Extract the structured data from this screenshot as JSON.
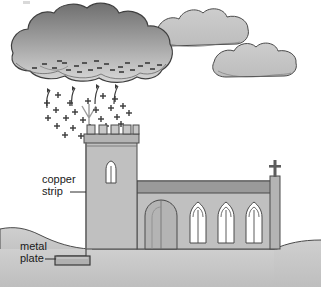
{
  "figure": {
    "labels": {
      "copper_strip_line1": "copper",
      "copper_strip_line2": "strip",
      "metal_plate_line1": "metal",
      "metal_plate_line2": "plate"
    },
    "charge_symbols": {
      "negative": "–",
      "positive": "+"
    },
    "counts": {
      "crenellations": 5,
      "nave_windows": 3,
      "clouds": 3,
      "charge_arrows": 4,
      "negative_charges": 22,
      "positive_charges": 24
    },
    "colors": {
      "outline": "#3a3a3a",
      "storm_cloud_top": "#7d7d7d",
      "storm_cloud_bottom": "#d2d2d2",
      "light_cloud": "#c3c3c3",
      "wall": "#c0c0c0",
      "wall_shadow": "#a8a8a8",
      "roof_band": "#9a9a9a",
      "ground": "#c6c6c6",
      "window_glass": "#ffffff",
      "metal_plate": "#b0b0b0",
      "text": "#1a1a1a"
    }
  }
}
